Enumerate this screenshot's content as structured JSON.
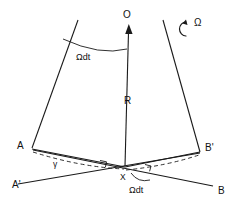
{
  "figure": {
    "ink_color": "#1a1a1a",
    "background_color": "#ffffff",
    "labels": {
      "apex": "O",
      "radius": "R",
      "angle_top": "Ωdt",
      "rotation": "Ω",
      "vertex_left": "A",
      "vertex_left_prime": "A'",
      "vertex_right_prime": "B'",
      "vertex_right": "B",
      "center": "X",
      "gamma": "γ",
      "angle_bottom": "Ωdt"
    },
    "geometry": {
      "apex_arrow_tip": [
        128,
        26
      ],
      "apex_arrow_base": [
        125,
        166
      ],
      "left_edge": [
        [
          78,
          20
        ],
        [
          32,
          148
        ]
      ],
      "right_edge": [
        [
          163,
          20
        ],
        [
          200,
          152
        ]
      ],
      "chord_A_to_X": [
        [
          32,
          148
        ],
        [
          125,
          167
        ]
      ],
      "chord_X_to_Bprime": [
        [
          125,
          167
        ],
        [
          200,
          152
        ]
      ],
      "line_Aprime_to_Bprime": [
        [
          18,
          184
        ],
        [
          200,
          152
        ]
      ],
      "line_A_to_B": [
        [
          32,
          150
        ],
        [
          213,
          186
        ]
      ],
      "center_point": [
        125,
        167
      ]
    }
  }
}
